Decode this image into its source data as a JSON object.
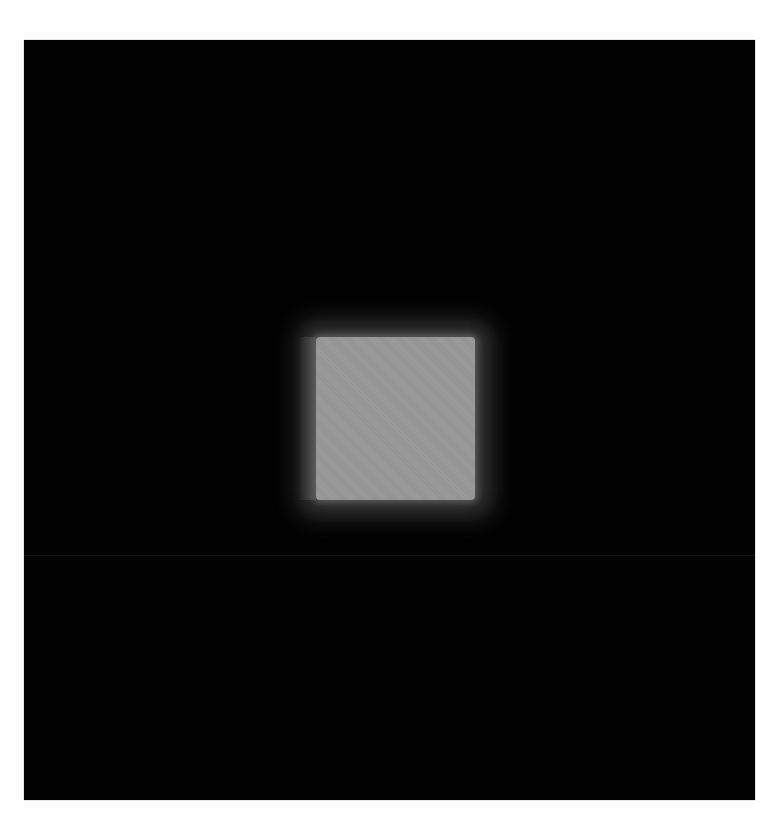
{
  "image": {
    "kind": "grayscale-micrograph",
    "background_color": "#ffffff",
    "field": {
      "color": "#020202",
      "left": 24,
      "top": 40,
      "width": 731,
      "height": 760,
      "seam_y": 515
    },
    "bright_square": {
      "color": "#989898",
      "halo_color": "#2a2a2a",
      "left": 292,
      "top": 297,
      "width": 159,
      "height": 163
    }
  }
}
